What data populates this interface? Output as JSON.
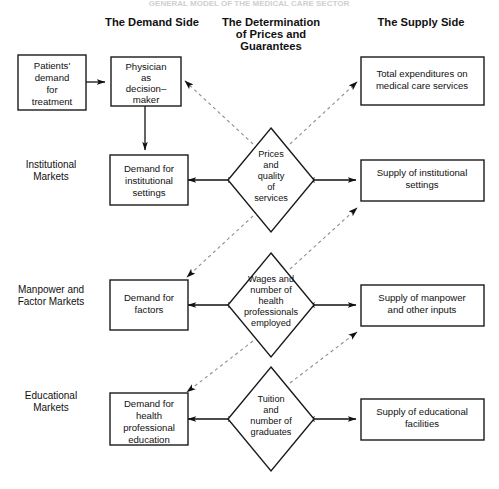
{
  "page": {
    "title": "GENERAL MODEL OF THE MEDICAL CARE SECTOR"
  },
  "column_headings": [
    {
      "id": "demand-side",
      "lines": [
        "The Demand Side"
      ]
    },
    {
      "id": "determination",
      "lines": [
        "The Determination",
        "of Prices and",
        "Guarantees"
      ]
    },
    {
      "id": "supply-side",
      "lines": [
        "The Supply Side"
      ]
    }
  ],
  "row_labels": [
    {
      "id": "institutional-markets",
      "lines": [
        "Institutional",
        "Markets"
      ]
    },
    {
      "id": "manpower-factor-markets",
      "lines": [
        "Manpower and",
        "Factor Markets"
      ]
    },
    {
      "id": "educational-markets",
      "lines": [
        "Educational",
        "Markets"
      ]
    }
  ],
  "nodes": {
    "patients_demand": {
      "lines": [
        "Patients'",
        "demand",
        "for",
        "treatment"
      ]
    },
    "physician": {
      "lines": [
        "Physician",
        "as",
        "decision–",
        "maker"
      ]
    },
    "demand_institutional": {
      "lines": [
        "Demand for",
        "institutional",
        "settings"
      ]
    },
    "demand_factors": {
      "lines": [
        "Demand for",
        "factors"
      ]
    },
    "demand_education": {
      "lines": [
        "Demand for",
        "health",
        "professional",
        "education"
      ]
    },
    "prices_quality": {
      "lines": [
        "Prices",
        "and",
        "quality",
        "of",
        "services"
      ]
    },
    "wages_number": {
      "lines": [
        "Wages and",
        "number of",
        "health",
        "professionals",
        "employed"
      ]
    },
    "tuition_graduates": {
      "lines": [
        "Tuition",
        "and",
        "number of",
        "graduates"
      ]
    },
    "total_expenditures": {
      "lines": [
        "Total expenditures on",
        "medical care services"
      ]
    },
    "supply_institutional": {
      "lines": [
        "Supply of institutional",
        "settings"
      ]
    },
    "supply_manpower": {
      "lines": [
        "Supply of manpower",
        "and other inputs"
      ]
    },
    "supply_educational": {
      "lines": [
        "Supply of educational",
        "facilities"
      ]
    }
  },
  "colors": {
    "stroke": "#1a1a1a",
    "dashed": "#8d8d8d",
    "background": "#ffffff",
    "text": "#111111"
  },
  "edges": [
    {
      "id": "patients-to-physician",
      "style": "solid",
      "direction": "one-way"
    },
    {
      "id": "physician-to-demand-institutional",
      "style": "solid",
      "direction": "one-way"
    },
    {
      "id": "demand-institutional-to-prices",
      "style": "solid",
      "direction": "two-way"
    },
    {
      "id": "prices-to-supply-institutional",
      "style": "solid",
      "direction": "two-way"
    },
    {
      "id": "demand-factors-to-wages",
      "style": "solid",
      "direction": "two-way"
    },
    {
      "id": "wages-to-supply-manpower",
      "style": "solid",
      "direction": "two-way"
    },
    {
      "id": "demand-education-to-tuition",
      "style": "solid",
      "direction": "two-way"
    },
    {
      "id": "tuition-to-supply-educational",
      "style": "solid",
      "direction": "two-way"
    },
    {
      "id": "prices-to-physician",
      "style": "dashed",
      "direction": "one-way"
    },
    {
      "id": "prices-to-total-expenditures",
      "style": "dashed",
      "direction": "one-way"
    },
    {
      "id": "prices-to-demand-factors",
      "style": "dashed",
      "direction": "one-way"
    },
    {
      "id": "wages-to-supply-institutional",
      "style": "dashed",
      "direction": "one-way"
    },
    {
      "id": "wages-to-demand-education",
      "style": "dashed",
      "direction": "one-way"
    },
    {
      "id": "tuition-to-supply-manpower",
      "style": "dashed",
      "direction": "one-way"
    }
  ]
}
